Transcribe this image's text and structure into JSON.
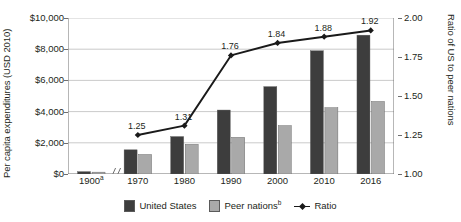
{
  "chart_data": {
    "type": "bar",
    "title": "",
    "subtitle": "",
    "xlabel": "",
    "ylabel": "Per capita expenditures (USD 2010)",
    "y2label": "Ratio of US to peer nations",
    "categories": [
      "1900ᵃ",
      "1970",
      "1980",
      "1990",
      "2000",
      "2010",
      "2016"
    ],
    "ylim": [
      0,
      10000
    ],
    "y2lim": [
      1.0,
      2.0
    ],
    "yticks": [
      0,
      2000,
      4000,
      6000,
      8000,
      10000
    ],
    "yticklabels": [
      "$0",
      "$2,000",
      "$4,000",
      "$6,000",
      "$8,000",
      "$10,000"
    ],
    "y2ticks": [
      1.0,
      1.25,
      1.5,
      1.75,
      2.0
    ],
    "y2ticklabels": [
      "1.00",
      "1.25",
      "1.50",
      "1.75",
      "2.00"
    ],
    "grid": true,
    "legend_position": "bottom",
    "axis_break_after_category": "1900ᵃ",
    "series": [
      {
        "name": "United States",
        "type": "bar",
        "axis": "left",
        "color": "#3d3d3d",
        "values": [
          150,
          1550,
          2400,
          4100,
          5600,
          7900,
          8900
        ]
      },
      {
        "name": "Peer nationsᵇ",
        "type": "bar",
        "axis": "left",
        "color": "#a9a9a9",
        "values": [
          120,
          1250,
          1900,
          2350,
          3100,
          4250,
          4650
        ]
      },
      {
        "name": "Ratio",
        "type": "line",
        "axis": "right",
        "color": "#1a1a1a",
        "values": [
          null,
          1.25,
          1.31,
          1.76,
          1.84,
          1.88,
          1.92
        ],
        "point_labels": [
          "",
          "1.25",
          "1.31",
          "1.76",
          "1.84",
          "1.88",
          "1.92"
        ]
      }
    ]
  },
  "legend": {
    "items": [
      {
        "label": "United States",
        "sup": "",
        "marker": "square",
        "color": "#3d3d3d"
      },
      {
        "label": "Peer nations",
        "sup": "b",
        "marker": "square",
        "color": "#a9a9a9"
      },
      {
        "label": "Ratio",
        "sup": "",
        "marker": "line",
        "color": "#1a1a1a"
      }
    ]
  },
  "axes": {
    "left_title": "Per capita expenditures (USD 2010)",
    "right_title": "Ratio of US to peer nations"
  },
  "colors": {
    "us_bar": "#3d3d3d",
    "peer_bar": "#a9a9a9",
    "ratio_line": "#1a1a1a",
    "grid": "#bcbcbc",
    "axis": "#6f6f6f",
    "text": "#231f20",
    "background": "#ffffff"
  }
}
